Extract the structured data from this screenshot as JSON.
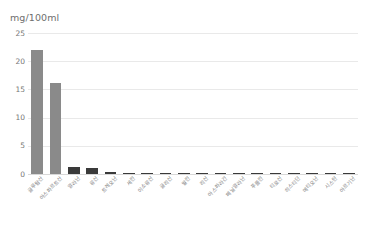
{
  "chart_data": {
    "type": "bar",
    "title": "mg/100ml",
    "xlabel": "",
    "ylabel": "mg/100ml",
    "ylim": [
      0,
      25
    ],
    "yticks": [
      0,
      5,
      10,
      15,
      20,
      25
    ],
    "ytick_labels": [
      "0",
      "5",
      "10",
      "15",
      "20",
      "25"
    ],
    "grid": "horizontal",
    "legend": "none",
    "bar_color": "#8a8a8a",
    "bar_color_small": "#3a3a3a",
    "categories": [
      "글루탐산",
      "아스파르트산",
      "알라닌",
      "류신",
      "트레오닌",
      "세린",
      "이소류신",
      "글리신",
      "발린",
      "리신",
      "아스파라긴",
      "페닐알라닌",
      "푸롤린",
      "티로신",
      "히스티딘",
      "메티오닌",
      "시스틴",
      "아르기닌"
    ],
    "values": [
      22.0,
      16.2,
      1.3,
      1.0,
      0.4,
      0.05,
      0.05,
      0.05,
      0.05,
      0.05,
      0.05,
      0.05,
      0.05,
      0.05,
      0.05,
      0.05,
      0.05,
      0.05
    ]
  }
}
